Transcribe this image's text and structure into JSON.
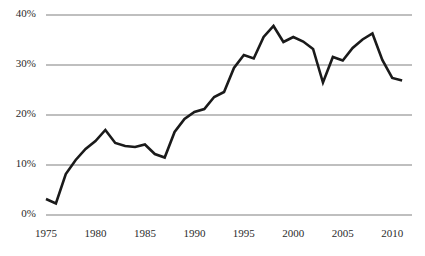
{
  "chart_data": {
    "type": "line",
    "title": "",
    "subtitle": "",
    "xlabel": "",
    "ylabel": "",
    "xlim": [
      1975,
      2012
    ],
    "ylim": [
      0,
      40
    ],
    "grid": "horizontal",
    "legend": "none",
    "line_color": "#1a1a1a",
    "gridline_color": "#808080",
    "x_tick_labels": [
      "1975",
      "1980",
      "1985",
      "1990",
      "1995",
      "2000",
      "2005",
      "2010"
    ],
    "x_tick_values": [
      1975,
      1980,
      1985,
      1990,
      1995,
      2000,
      2005,
      2010
    ],
    "y_tick_labels": [
      "0%",
      "10%",
      "20%",
      "30%",
      "40%"
    ],
    "y_tick_values": [
      0,
      10,
      20,
      30,
      40
    ],
    "x": [
      1975,
      1976,
      1977,
      1978,
      1979,
      1980,
      1981,
      1982,
      1983,
      1984,
      1985,
      1986,
      1987,
      1988,
      1989,
      1990,
      1991,
      1992,
      1993,
      1994,
      1995,
      1996,
      1997,
      1998,
      1999,
      2000,
      2001,
      2002,
      2003,
      2004,
      2005,
      2006,
      2007,
      2008,
      2009,
      2010,
      2011
    ],
    "values": [
      3.2,
      2.3,
      8.2,
      11.0,
      13.2,
      14.8,
      17.0,
      14.4,
      13.8,
      13.6,
      14.1,
      12.2,
      11.5,
      16.6,
      19.2,
      20.6,
      21.2,
      23.6,
      24.6,
      29.4,
      32.0,
      31.3,
      35.6,
      37.8,
      34.6,
      35.6,
      34.7,
      33.2,
      26.5,
      31.6,
      30.9,
      33.4,
      35.1,
      36.3,
      31.0,
      27.4,
      26.9
    ],
    "series_name": ""
  }
}
